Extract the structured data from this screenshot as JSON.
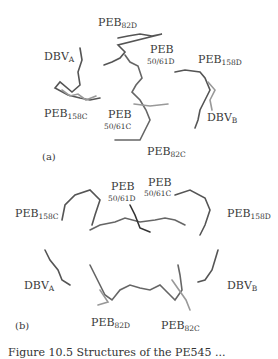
{
  "figure": {
    "panel_a": {
      "tag": "(a)",
      "labels": {
        "dbv_a": {
          "base": "DBV",
          "sub": "A"
        },
        "peb_82d": {
          "base": "PEB",
          "sub": "82D"
        },
        "peb_5061d": {
          "base": "PEB",
          "sub": "50/61D"
        },
        "peb_158d": {
          "base": "PEB",
          "sub": "158D"
        },
        "peb_158c": {
          "base": "PEB",
          "sub": "158C"
        },
        "peb_5061c": {
          "base": "PEB",
          "sub": "50/61C"
        },
        "dbv_b": {
          "base": "DBV",
          "sub": "B"
        },
        "peb_82c": {
          "base": "PEB",
          "sub": "82C"
        }
      }
    },
    "panel_b": {
      "tag": "(b)",
      "labels": {
        "peb_5061d": {
          "base": "PEB",
          "sub": "50/61D"
        },
        "peb_5061c": {
          "base": "PEB",
          "sub": "50/61C"
        },
        "peb_158c": {
          "base": "PEB",
          "sub": "158C"
        },
        "peb_158d": {
          "base": "PEB",
          "sub": "158D"
        },
        "dbv_a": {
          "base": "DBV",
          "sub": "A"
        },
        "dbv_b": {
          "base": "DBV",
          "sub": "B"
        },
        "peb_82d": {
          "base": "PEB",
          "sub": "82D"
        },
        "peb_82c": {
          "base": "PEB",
          "sub": "82C"
        }
      }
    },
    "caption_partial": "Figure 10.5 Structures of the PE545 ...",
    "colors": {
      "stick_dark": "#222222",
      "stick_mid": "#777777",
      "stick_light": "#bbbbbb"
    }
  }
}
